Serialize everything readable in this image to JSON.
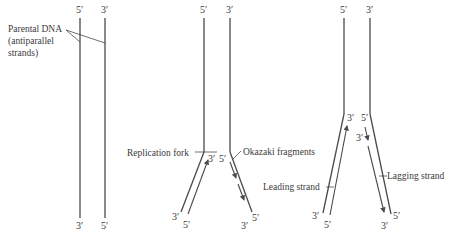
{
  "diagram": {
    "type": "dna-replication-fork",
    "panels": [
      {
        "id": "parental",
        "top_labels": [
          "5′",
          "3′"
        ],
        "bottom_labels": [
          "3′",
          "5′"
        ],
        "annotation": {
          "line1": "Parental DNA",
          "line2": "(antiparallel",
          "line3": "strands)"
        }
      },
      {
        "id": "fork-opening",
        "top_labels": [
          "5′",
          "3′"
        ],
        "fork_labels": {
          "left_inner": "3′",
          "right_inner": "5′",
          "left_bottom_outer": "3′",
          "left_bottom_inner": "5′",
          "right_bottom_inner": "3′",
          "right_bottom_outer": "5′"
        },
        "annotations": {
          "replication_fork": "Replication fork",
          "okazaki": "Okazaki fragments"
        }
      },
      {
        "id": "extended-fork",
        "top_labels": [
          "5′",
          "3′"
        ],
        "fork_labels": {
          "left_inner": "3′",
          "right_inner": "5′",
          "right_new": "3′",
          "left_bottom_outer": "3′",
          "left_bottom_inner": "5′",
          "right_bottom_inner": "3′",
          "right_bottom_outer": "5′"
        },
        "annotations": {
          "leading": "Leading strand",
          "lagging": "Lagging strand"
        }
      }
    ],
    "colors": {
      "strand": "#4a4a4a",
      "text": "#3a3a3a",
      "background": "#ffffff"
    }
  }
}
